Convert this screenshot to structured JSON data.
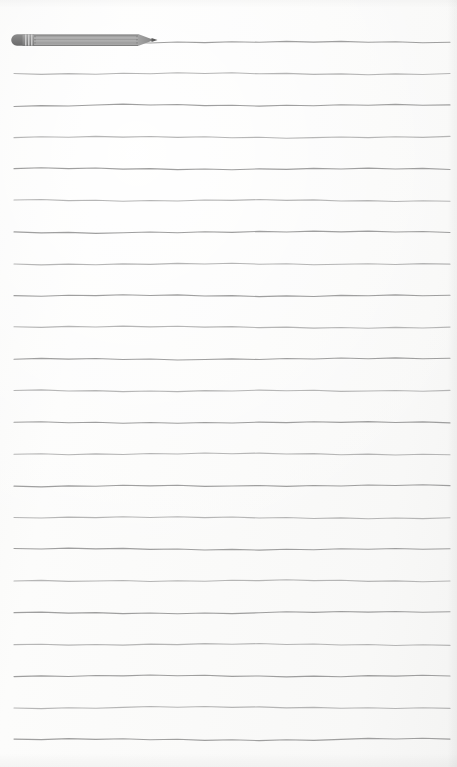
{
  "page": {
    "kind": "lined-notepad-page",
    "width": 457,
    "height": 767,
    "background_color": "#fbfbfa",
    "paper_tint_color": "#f7f7f6",
    "edge_shadow_color": "#e6e6e4"
  },
  "ruling": {
    "line_color": "#8e8e8e",
    "line_color_light": "#a9a9a9",
    "line_thickness": 1.1,
    "line_left_x": 14,
    "line_right_x": 450,
    "first_line_y": 42,
    "line_spacing": 31.7,
    "line_count": 23,
    "style": "hand-drawn-wavy",
    "line_y_positions": [
      42,
      73.7,
      105.4,
      137.1,
      168.8,
      200.5,
      232.2,
      263.9,
      295.6,
      327.3,
      359.0,
      390.7,
      422.4,
      454.1,
      485.8,
      517.5,
      549.2,
      580.9,
      612.6,
      644.3,
      676.0,
      707.7,
      739.4
    ],
    "line_text_values": [
      "",
      "",
      "",
      "",
      "",
      "",
      "",
      "",
      "",
      "",
      "",
      "",
      "",
      "",
      "",
      "",
      "",
      "",
      "",
      "",
      "",
      "",
      ""
    ],
    "placeholder": ""
  },
  "pencil": {
    "icon_name": "pencil-icon",
    "label": "Pencil",
    "x": 10,
    "y": 31,
    "width": 150,
    "height": 18,
    "orientation": "horizontal-tip-right",
    "body_color": "#8d8d8d",
    "body_highlight_color": "#b4b4b4",
    "body_shadow_color": "#6f6f6f",
    "ferrule_color": "#9a9a9a",
    "ferrule_band_color": "#cfcfcf",
    "eraser_color": "#7e7e7e",
    "tip_wood_color": "#a6a6a6",
    "tip_lead_color": "#5c5c5c",
    "ferrule_band_count": 3,
    "body_groove_count": 3
  }
}
